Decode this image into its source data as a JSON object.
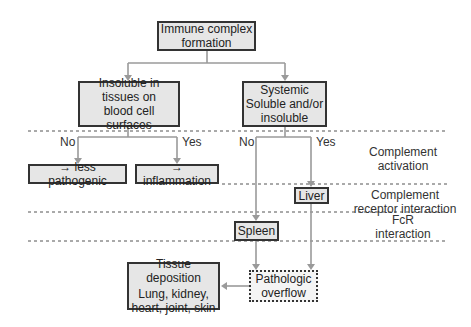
{
  "nodes": {
    "root": {
      "lines": [
        "Immune complex",
        "formation"
      ]
    },
    "insoluble": {
      "lines": [
        "Insoluble in",
        "tissues on",
        "blood cell surfaces"
      ]
    },
    "systemic": {
      "lines": [
        "Systemic",
        "Soluble and/or",
        "insoluble"
      ]
    },
    "less_pathogenic": {
      "lines": [
        "→ less pathogenic"
      ]
    },
    "inflammation": {
      "lines": [
        "→ inflammation"
      ]
    },
    "liver": {
      "lines": [
        "Liver"
      ]
    },
    "spleen": {
      "lines": [
        "Spleen"
      ]
    },
    "tissue": {
      "lines": [
        "Tissue deposition",
        "Lung, kidney,",
        "heart, joint, skin"
      ]
    },
    "overflow": {
      "lines": [
        "Pathologic",
        "overflow"
      ]
    }
  },
  "branch_labels": {
    "left_no": "No",
    "left_yes": "Yes",
    "right_no": "No",
    "right_yes": "Yes"
  },
  "stages": [
    {
      "lines": [
        "Complement",
        "activation"
      ]
    },
    {
      "lines": [
        "Complement",
        "receptor interaction"
      ]
    },
    {
      "lines": [
        "FcR",
        "interaction"
      ]
    }
  ],
  "colors": {
    "box_fill": "#e6e6e6",
    "box_border": "#333333",
    "arrow": "#9a9a9a",
    "dash": "#555555"
  }
}
